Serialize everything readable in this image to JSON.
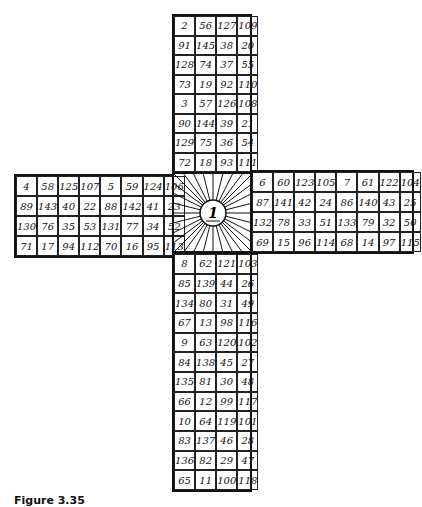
{
  "figure": {
    "caption": "Figure 3.35",
    "center_label": "1",
    "arms": {
      "top": [
        [
          "2",
          "56",
          "127",
          "109"
        ],
        [
          "91",
          "145",
          "38",
          "20"
        ],
        [
          "128",
          "74",
          "37",
          "55"
        ],
        [
          "73",
          "19",
          "92",
          "110"
        ],
        [
          "3",
          "57",
          "126",
          "108"
        ],
        [
          "90",
          "144",
          "39",
          "21"
        ],
        [
          "129",
          "75",
          "36",
          "54"
        ],
        [
          "72",
          "18",
          "93",
          "111"
        ]
      ],
      "left": [
        [
          "4",
          "58",
          "125",
          "107",
          "5",
          "59",
          "124",
          "106"
        ],
        [
          "89",
          "143",
          "40",
          "22",
          "88",
          "142",
          "41",
          "23"
        ],
        [
          "130",
          "76",
          "35",
          "53",
          "131",
          "77",
          "34",
          "52"
        ],
        [
          "71",
          "17",
          "94",
          "112",
          "70",
          "16",
          "95",
          "113"
        ]
      ],
      "right": [
        [
          "6",
          "60",
          "123",
          "105",
          "7",
          "61",
          "122",
          "104"
        ],
        [
          "87",
          "141",
          "42",
          "24",
          "86",
          "140",
          "43",
          "25"
        ],
        [
          "132",
          "78",
          "33",
          "51",
          "133",
          "79",
          "32",
          "50"
        ],
        [
          "69",
          "15",
          "96",
          "114",
          "68",
          "14",
          "97",
          "115"
        ]
      ],
      "bottom": [
        [
          "8",
          "62",
          "121",
          "103"
        ],
        [
          "85",
          "139",
          "44",
          "26"
        ],
        [
          "134",
          "80",
          "31",
          "49"
        ],
        [
          "67",
          "13",
          "98",
          "116"
        ],
        [
          "9",
          "63",
          "120",
          "102"
        ],
        [
          "84",
          "138",
          "45",
          "27"
        ],
        [
          "135",
          "81",
          "30",
          "48"
        ],
        [
          "66",
          "12",
          "99",
          "117"
        ],
        [
          "10",
          "64",
          "119",
          "101"
        ],
        [
          "83",
          "137",
          "46",
          "28"
        ],
        [
          "136",
          "82",
          "29",
          "47"
        ],
        [
          "65",
          "11",
          "100",
          "118"
        ]
      ]
    }
  }
}
